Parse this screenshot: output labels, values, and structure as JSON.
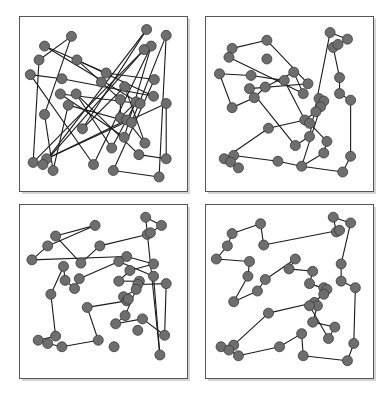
{
  "figure": {
    "colors": {
      "node_fill": "#6e6e6e",
      "node_stroke": "#3a3a3a",
      "edge": "#1a1a1a",
      "frame": "#555555",
      "shadow": "#d4d4d4"
    },
    "panels": [
      {
        "name": "panel-random-tour",
        "nodes": [
          [
            0.776,
            0.052
          ],
          [
            0.9,
            0.087
          ],
          [
            0.3,
            0.093
          ],
          [
            0.13,
            0.152
          ],
          [
            0.805,
            0.152
          ],
          [
            0.76,
            0.173
          ],
          [
            0.095,
            0.236
          ],
          [
            0.335,
            0.236
          ],
          [
            0.04,
            0.325
          ],
          [
            0.52,
            0.315
          ],
          [
            0.24,
            0.35
          ],
          [
            0.49,
            0.37
          ],
          [
            0.825,
            0.355
          ],
          [
            0.637,
            0.398
          ],
          [
            0.23,
            0.442
          ],
          [
            0.33,
            0.442
          ],
          [
            0.82,
            0.456
          ],
          [
            0.28,
            0.51
          ],
          [
            0.61,
            0.476
          ],
          [
            0.71,
            0.49
          ],
          [
            0.735,
            0.5
          ],
          [
            0.9,
            0.5
          ],
          [
            0.13,
            0.566
          ],
          [
            0.61,
            0.586
          ],
          [
            0.65,
            0.6
          ],
          [
            0.68,
            0.615
          ],
          [
            0.37,
            0.653
          ],
          [
            0.634,
            0.705
          ],
          [
            0.765,
            0.74
          ],
          [
            0.555,
            0.77
          ],
          [
            0.727,
            0.81
          ],
          [
            0.058,
            0.857
          ],
          [
            0.143,
            0.835
          ],
          [
            0.12,
            0.87
          ],
          [
            0.184,
            0.906
          ],
          [
            0.44,
            0.87
          ],
          [
            0.565,
            0.906
          ],
          [
            0.855,
            0.945
          ],
          [
            0.9,
            0.835
          ]
        ],
        "tour": [
          0,
          33,
          5,
          31,
          6,
          2,
          22,
          34,
          17,
          25,
          1,
          37,
          36,
          12,
          9,
          3,
          20,
          14,
          27,
          4,
          35,
          8,
          10,
          16,
          7,
          11,
          18,
          23,
          19,
          29,
          15,
          30,
          38,
          21,
          32,
          24,
          28,
          13,
          26,
          0
        ]
      },
      {
        "name": "panel-tour-improved",
        "nodes": [
          [
            0.76,
            0.07
          ],
          [
            0.87,
            0.11
          ],
          [
            0.78,
            0.16
          ],
          [
            0.81,
            0.142
          ],
          [
            0.36,
            0.117
          ],
          [
            0.14,
            0.166
          ],
          [
            0.12,
            0.22
          ],
          [
            0.36,
            0.23
          ],
          [
            0.06,
            0.32
          ],
          [
            0.26,
            0.33
          ],
          [
            0.53,
            0.31
          ],
          [
            0.47,
            0.36
          ],
          [
            0.62,
            0.38
          ],
          [
            0.82,
            0.343
          ],
          [
            0.25,
            0.41
          ],
          [
            0.35,
            0.4
          ],
          [
            0.59,
            0.44
          ],
          [
            0.28,
            0.465
          ],
          [
            0.14,
            0.525
          ],
          [
            0.69,
            0.47
          ],
          [
            0.72,
            0.485
          ],
          [
            0.82,
            0.44
          ],
          [
            0.89,
            0.48
          ],
          [
            0.7,
            0.52
          ],
          [
            0.67,
            0.55
          ],
          [
            0.6,
            0.6
          ],
          [
            0.63,
            0.62
          ],
          [
            0.37,
            0.65
          ],
          [
            0.63,
            0.7
          ],
          [
            0.54,
            0.755
          ],
          [
            0.74,
            0.73
          ],
          [
            0.72,
            0.8
          ],
          [
            0.09,
            0.835
          ],
          [
            0.15,
            0.815
          ],
          [
            0.13,
            0.855
          ],
          [
            0.18,
            0.89
          ],
          [
            0.43,
            0.85
          ],
          [
            0.58,
            0.88
          ],
          [
            0.89,
            0.82
          ],
          [
            0.84,
            0.915
          ]
        ],
        "tour": [
          0,
          1,
          3,
          2,
          13,
          21,
          22,
          38,
          39,
          37,
          36,
          33,
          34,
          35,
          32,
          27,
          25,
          24,
          19,
          20,
          23,
          37,
          31,
          30,
          26,
          25,
          11,
          9,
          8,
          18,
          17,
          15,
          10,
          16,
          6,
          5,
          4,
          12,
          14,
          29,
          28,
          0
        ]
      },
      {
        "name": "panel-tour-two-opt",
        "nodes": [
          [
            0.77,
            0.05
          ],
          [
            0.87,
            0.1
          ],
          [
            0.78,
            0.155
          ],
          [
            0.8,
            0.145
          ],
          [
            0.45,
            0.1
          ],
          [
            0.2,
            0.165
          ],
          [
            0.15,
            0.225
          ],
          [
            0.48,
            0.225
          ],
          [
            0.05,
            0.31
          ],
          [
            0.65,
            0.29
          ],
          [
            0.6,
            0.32
          ],
          [
            0.36,
            0.33
          ],
          [
            0.82,
            0.335
          ],
          [
            0.25,
            0.35
          ],
          [
            0.67,
            0.375
          ],
          [
            0.82,
            0.41
          ],
          [
            0.26,
            0.435
          ],
          [
            0.35,
            0.425
          ],
          [
            0.6,
            0.44
          ],
          [
            0.73,
            0.44
          ],
          [
            0.72,
            0.46
          ],
          [
            0.9,
            0.455
          ],
          [
            0.32,
            0.485
          ],
          [
            0.17,
            0.52
          ],
          [
            0.71,
            0.49
          ],
          [
            0.63,
            0.535
          ],
          [
            0.65,
            0.56
          ],
          [
            0.66,
            0.55
          ],
          [
            0.4,
            0.6
          ],
          [
            0.64,
            0.65
          ],
          [
            0.75,
            0.67
          ],
          [
            0.58,
            0.7
          ],
          [
            0.72,
            0.74
          ],
          [
            0.89,
            0.77
          ],
          [
            0.2,
            0.775
          ],
          [
            0.09,
            0.8
          ],
          [
            0.15,
            0.82
          ],
          [
            0.24,
            0.84
          ],
          [
            0.47,
            0.8
          ],
          [
            0.57,
            0.84
          ],
          [
            0.86,
            0.89
          ]
        ],
        "tour": [
          0,
          1,
          3,
          2,
          7,
          11,
          5,
          4,
          6,
          8,
          9,
          12,
          14,
          18,
          19,
          20,
          21,
          33,
          30,
          31,
          29,
          24,
          25,
          26,
          28,
          38,
          37,
          36,
          35,
          34,
          23,
          13,
          16,
          22,
          17,
          10,
          15,
          40,
          0
        ]
      },
      {
        "name": "panel-tour-optimized",
        "nodes": [
          [
            0.78,
            0.05
          ],
          [
            0.89,
            0.085
          ],
          [
            0.8,
            0.14
          ],
          [
            0.82,
            0.13
          ],
          [
            0.32,
            0.09
          ],
          [
            0.14,
            0.15
          ],
          [
            0.11,
            0.225
          ],
          [
            0.34,
            0.22
          ],
          [
            0.04,
            0.305
          ],
          [
            0.25,
            0.32
          ],
          [
            0.54,
            0.305
          ],
          [
            0.5,
            0.365
          ],
          [
            0.65,
            0.38
          ],
          [
            0.83,
            0.335
          ],
          [
            0.24,
            0.41
          ],
          [
            0.35,
            0.43
          ],
          [
            0.63,
            0.455
          ],
          [
            0.72,
            0.48
          ],
          [
            0.74,
            0.49
          ],
          [
            0.83,
            0.44
          ],
          [
            0.92,
            0.48
          ],
          [
            0.15,
            0.565
          ],
          [
            0.3,
            0.5
          ],
          [
            0.72,
            0.52
          ],
          [
            0.66,
            0.57
          ],
          [
            0.68,
            0.59
          ],
          [
            0.63,
            0.59
          ],
          [
            0.37,
            0.635
          ],
          [
            0.65,
            0.69
          ],
          [
            0.79,
            0.72
          ],
          [
            0.75,
            0.79
          ],
          [
            0.58,
            0.76
          ],
          [
            0.15,
            0.83
          ],
          [
            0.07,
            0.84
          ],
          [
            0.12,
            0.86
          ],
          [
            0.18,
            0.895
          ],
          [
            0.44,
            0.84
          ],
          [
            0.59,
            0.895
          ],
          [
            0.91,
            0.82
          ],
          [
            0.87,
            0.925
          ]
        ],
        "tour": [
          0,
          1,
          13,
          19,
          20,
          38,
          39,
          37,
          31,
          36,
          35,
          34,
          33,
          32,
          27,
          24,
          25,
          28,
          29,
          30,
          26,
          23,
          17,
          18,
          16,
          12,
          11,
          10,
          15,
          22,
          21,
          14,
          9,
          8,
          6,
          5,
          4,
          7,
          3,
          2,
          0
        ]
      }
    ]
  }
}
